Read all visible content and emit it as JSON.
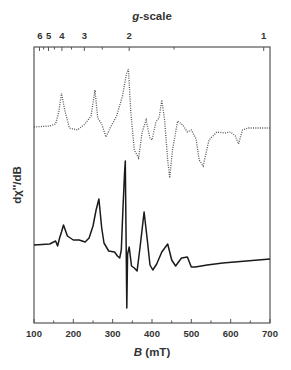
{
  "chart_data": {
    "type": "line",
    "title": "",
    "xlabel": "B (mT)",
    "xlabel_italic_part": "B",
    "xlabel_unit": "(mT)",
    "ylabel": "dχ''/dB",
    "top_axis_label": "g-scale",
    "top_axis_label_italic_part": "g",
    "top_axis_label_rest": "-scale",
    "xlim": [
      100,
      700
    ],
    "x_ticks": [
      100,
      200,
      300,
      400,
      500,
      600,
      700
    ],
    "x_tick_labels": [
      "100",
      "200",
      "300",
      "400",
      "500",
      "600",
      "700"
    ],
    "g_ticks_labeled": [
      {
        "g": "6",
        "B": 115
      },
      {
        "g": "5",
        "B": 137
      },
      {
        "g": "4",
        "B": 171
      },
      {
        "g": "3",
        "B": 228
      },
      {
        "g": "2",
        "B": 342
      },
      {
        "g": "1",
        "B": 684
      }
    ],
    "grid": false,
    "legend": null,
    "y_ticks_visible": false,
    "series": [
      {
        "name": "simulated",
        "style": "dotted",
        "B": [
          100,
          140,
          155,
          163,
          170,
          178,
          190,
          210,
          230,
          245,
          255,
          262,
          272,
          283,
          295,
          310,
          325,
          335,
          340,
          346,
          355,
          366,
          375,
          385,
          395,
          400,
          410,
          418,
          425,
          432,
          440,
          445,
          452,
          465,
          478,
          490,
          500,
          512,
          520,
          530,
          545,
          565,
          585,
          600,
          612,
          620,
          630,
          645,
          700
        ],
        "y_px": [
          127,
          126,
          124,
          112,
          93,
          110,
          128,
          130,
          124,
          116,
          90,
          118,
          124,
          137,
          127,
          116,
          96,
          74,
          69,
          112,
          150,
          158,
          132,
          120,
          138,
          140,
          122,
          118,
          100,
          120,
          160,
          178,
          150,
          121,
          125,
          132,
          130,
          139,
          160,
          166,
          140,
          132,
          133,
          132,
          136,
          144,
          130,
          128,
          128
        ]
      },
      {
        "name": "experimental",
        "style": "solid",
        "B": [
          100,
          140,
          155,
          160,
          165,
          170,
          175,
          185,
          200,
          215,
          230,
          240,
          250,
          258,
          265,
          272,
          278,
          290,
          305,
          312,
          318,
          322,
          326,
          330,
          332,
          334,
          336,
          338,
          342,
          348,
          355,
          362,
          370,
          380,
          388,
          395,
          402,
          412,
          425,
          440,
          450,
          460,
          475,
          490,
          500,
          510,
          540,
          580,
          640,
          700
        ],
        "y_px": [
          245,
          244,
          241,
          246,
          238,
          232,
          225,
          236,
          240,
          240,
          242,
          238,
          226,
          210,
          199,
          228,
          243,
          251,
          252,
          256,
          258,
          250,
          210,
          174,
          161,
          230,
          308,
          254,
          247,
          266,
          268,
          271,
          246,
          212,
          240,
          265,
          270,
          264,
          252,
          244,
          260,
          266,
          258,
          257,
          267,
          267,
          265,
          263,
          261,
          259
        ]
      }
    ]
  },
  "plot": {
    "frame": {
      "left": 34,
      "top": 47,
      "right": 270,
      "bottom": 323
    },
    "line_color": "#1a1a1a",
    "dotted_color": "#555555",
    "frame_color": "#555555"
  }
}
